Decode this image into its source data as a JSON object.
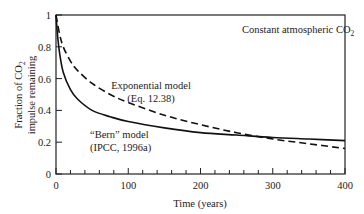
{
  "chart_data": {
    "type": "line",
    "title": "Constant atmospheric CO2",
    "annotation": {
      "text": "Constant atmospheric CO",
      "sub": "2"
    },
    "xlabel": "Time (years)",
    "ylabel_line1": "Fraction of CO",
    "ylabel_line1_sub": "2",
    "ylabel_line2": "impulse remaining",
    "xlim": [
      0,
      400
    ],
    "ylim": [
      0,
      1
    ],
    "x_ticks": [
      "0",
      "100",
      "200",
      "300",
      "400"
    ],
    "y_ticks": [
      "0",
      "0.2",
      "0.4",
      "0.6",
      "0.8",
      "1"
    ],
    "grid": false,
    "legend": "inline labels",
    "series": [
      {
        "name": "Exponential model (Eq. 12.38)",
        "label_line1": "Exponential model",
        "label_line2": "(Eq. 12.38)",
        "style": "dashed",
        "x": [
          0,
          5,
          10,
          20,
          30,
          50,
          75,
          100,
          150,
          200,
          250,
          300,
          350,
          400
        ],
        "values": [
          1.0,
          0.88,
          0.8,
          0.71,
          0.65,
          0.57,
          0.5,
          0.45,
          0.37,
          0.31,
          0.26,
          0.22,
          0.19,
          0.16
        ]
      },
      {
        "name": "\"Bern\" model (IPCC, 1996a)",
        "label_line1": "“Bern” model",
        "label_line2": "(IPCC, 1996a)",
        "style": "solid",
        "x": [
          0,
          2,
          5,
          10,
          20,
          30,
          50,
          75,
          100,
          150,
          200,
          250,
          300,
          350,
          400
        ],
        "values": [
          1.0,
          0.88,
          0.76,
          0.64,
          0.53,
          0.47,
          0.4,
          0.36,
          0.33,
          0.29,
          0.26,
          0.245,
          0.23,
          0.22,
          0.21
        ]
      }
    ]
  }
}
